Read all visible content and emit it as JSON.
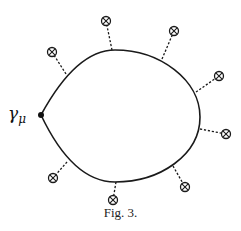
{
  "figure": {
    "caption": "Fig. 3.",
    "vertex_label": "γ",
    "vertex_label_subscript": "μ",
    "loop": {
      "cusp": [
        41,
        115
      ],
      "description": "closed fermion loop with a cusp at the γ_μ vertex"
    },
    "external_insertions": [
      {
        "source": [
          66,
          74
        ],
        "target": [
          52,
          52
        ],
        "symbol": "circled-cross"
      },
      {
        "source": [
          112,
          50
        ],
        "target": [
          106,
          21
        ],
        "symbol": "circled-cross"
      },
      {
        "source": [
          162,
          59
        ],
        "target": [
          174,
          31
        ],
        "symbol": "circled-cross"
      },
      {
        "source": [
          196,
          92
        ],
        "target": [
          219,
          76
        ],
        "symbol": "circled-cross"
      },
      {
        "source": [
          200,
          129
        ],
        "target": [
          226,
          134
        ],
        "symbol": "circled-cross"
      },
      {
        "source": [
          173,
          166
        ],
        "target": [
          185,
          187
        ],
        "symbol": "circled-cross"
      },
      {
        "source": [
          116,
          182
        ],
        "target": [
          113,
          200
        ],
        "symbol": "circled-cross"
      },
      {
        "source": [
          67,
          162
        ],
        "target": [
          53,
          178
        ],
        "symbol": "circled-cross"
      }
    ],
    "colors": {
      "line": "#1a1a1a",
      "background": "#ffffff"
    }
  }
}
